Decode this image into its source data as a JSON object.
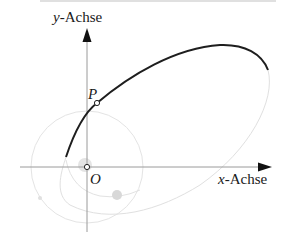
{
  "diagram": {
    "type": "orbit-ellipse",
    "axes": {
      "y_label_var": "y",
      "y_label_suffix": "-Achse",
      "x_label_var": "x",
      "x_label_suffix": "-Achse"
    },
    "points": {
      "P": {
        "label": "P"
      },
      "O": {
        "label": "O"
      }
    },
    "colors": {
      "axis": "#9a9a9a",
      "arrow": "#111111",
      "orbit_solid": "#1e1e1e",
      "orbit_faint": "#dcdcdc",
      "circle_faint": "#e2e2e2",
      "text": "#1a1a1a"
    }
  }
}
